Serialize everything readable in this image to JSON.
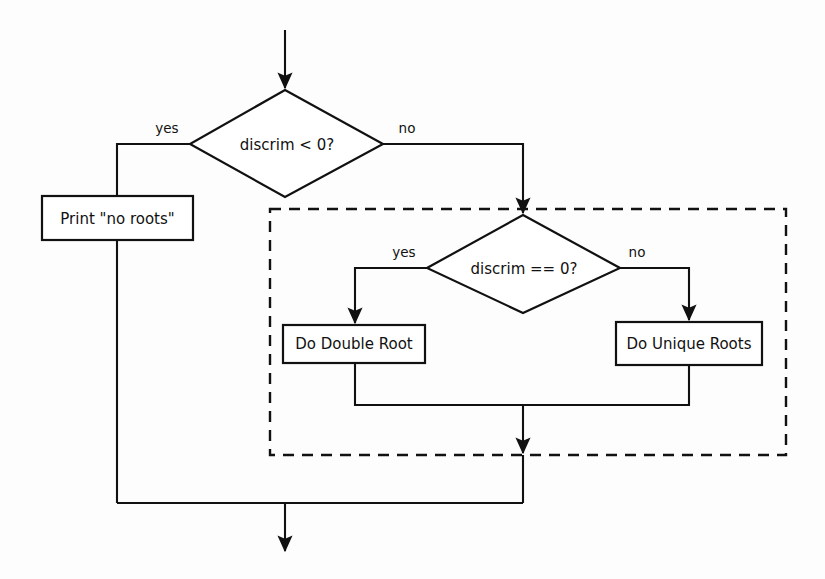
{
  "diagram": {
    "type": "flowchart",
    "colors": {
      "stroke": "#111111",
      "fill": "#ffffff",
      "background": "#fdfdfd"
    },
    "decisions": [
      {
        "id": "discrim-lt-zero",
        "label": "discrim < 0?",
        "yes_label": "yes",
        "no_label": "no"
      },
      {
        "id": "discrim-eq-zero",
        "label": "discrim == 0?",
        "yes_label": "yes",
        "no_label": "no"
      }
    ],
    "processes": [
      {
        "id": "print-no-roots",
        "label": "Print \"no roots\""
      },
      {
        "id": "do-double-root",
        "label": "Do Double Root"
      },
      {
        "id": "do-unique-roots",
        "label": "Do Unique Roots"
      }
    ],
    "group": {
      "id": "nested-decision-group",
      "style": "dashed",
      "label": ""
    }
  }
}
